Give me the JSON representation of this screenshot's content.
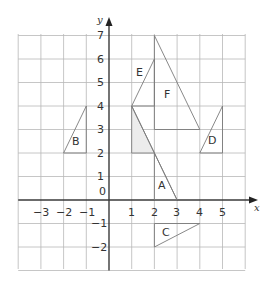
{
  "diagram": {
    "type": "coordinate-grid",
    "axes": {
      "x_label": "x",
      "y_label": "y",
      "origin_label": "0",
      "x_range": [
        -4,
        6
      ],
      "y_range": [
        -3,
        7
      ],
      "x_ticks": [
        "−3",
        "−2",
        "−1",
        "1",
        "2",
        "3",
        "4",
        "5"
      ],
      "y_ticks": [
        "7",
        "6",
        "5",
        "4",
        "3",
        "2",
        "1",
        "−1",
        "−2"
      ]
    },
    "shapes": [
      {
        "label": "A",
        "vertices": [
          [
            2,
            2
          ],
          [
            2,
            0
          ],
          [
            3,
            0
          ]
        ]
      },
      {
        "label": "B",
        "vertices": [
          [
            -2,
            2
          ],
          [
            -1,
            4
          ],
          [
            -1,
            2
          ]
        ]
      },
      {
        "label": "C",
        "vertices": [
          [
            2,
            -2
          ],
          [
            4,
            -1
          ],
          [
            2,
            -1
          ]
        ]
      },
      {
        "label": "D",
        "vertices": [
          [
            4,
            2
          ],
          [
            5,
            4
          ],
          [
            5,
            2
          ]
        ]
      },
      {
        "label": "E",
        "vertices": [
          [
            1,
            4
          ],
          [
            2,
            6
          ],
          [
            2,
            4
          ]
        ]
      },
      {
        "label": "F",
        "vertices": [
          [
            2,
            7
          ],
          [
            2,
            3
          ],
          [
            4,
            3
          ]
        ]
      }
    ],
    "shaded_shape": {
      "label": "",
      "vertices": [
        [
          1,
          4
        ],
        [
          1,
          2
        ],
        [
          2,
          2
        ]
      ],
      "fill": "#ececec"
    }
  }
}
